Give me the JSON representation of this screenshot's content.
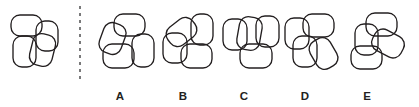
{
  "puzzle": {
    "type": "figure-matching-multiple-choice",
    "question_kind": "which-option-matches-reference-figure",
    "background_color": "#ffffff",
    "stroke_color": "#231f20",
    "divider_color": "#4d4d4f",
    "canvas": {
      "width": 419,
      "height": 107
    },
    "shape_primitive": "rounded-rectangle",
    "shapes_per_figure": 4,
    "divider": {
      "name": "dashed-vertical-divider",
      "x": 80,
      "y_top": 6,
      "y_bottom": 80,
      "style": "dashed"
    },
    "reference": {
      "name": "reference-figure",
      "shapes": [
        {
          "x": 11,
          "y": 15,
          "w": 31,
          "h": 21,
          "rx": 9,
          "rotate": 0,
          "cx": 26.5,
          "cy": 25.5
        },
        {
          "x": 36,
          "y": 21,
          "w": 22,
          "h": 30,
          "rx": 9,
          "rotate": 0,
          "cx": 47,
          "cy": 36
        },
        {
          "x": 13,
          "y": 36,
          "w": 23,
          "h": 31,
          "rx": 9,
          "rotate": 0,
          "cx": 24.5,
          "cy": 51.5
        },
        {
          "x": 31,
          "y": 34,
          "w": 23,
          "h": 32,
          "rx": 9,
          "rotate": 14,
          "cx": 42.5,
          "cy": 50
        }
      ]
    },
    "options": [
      {
        "id": "A",
        "label": "A",
        "name": "option-a",
        "label_x": 120,
        "label_y": 100,
        "shapes": [
          {
            "x": 114,
            "y": 14,
            "w": 31,
            "h": 22,
            "rx": 9,
            "rotate": 0,
            "cx": 129.5,
            "cy": 25
          },
          {
            "x": 101,
            "y": 23,
            "w": 23,
            "h": 31,
            "rx": 9,
            "rotate": 20,
            "cx": 112.5,
            "cy": 38.5
          },
          {
            "x": 103,
            "y": 44,
            "w": 31,
            "h": 24,
            "rx": 9,
            "rotate": 0,
            "cx": 118.5,
            "cy": 56
          },
          {
            "x": 132,
            "y": 34,
            "w": 22,
            "h": 33,
            "rx": 9,
            "rotate": 0,
            "cx": 143,
            "cy": 50.5
          }
        ]
      },
      {
        "id": "B",
        "label": "B",
        "name": "option-b",
        "label_x": 183,
        "label_y": 100,
        "shapes": [
          {
            "x": 166,
            "y": 21,
            "w": 31,
            "h": 22,
            "rx": 9,
            "rotate": -38,
            "cx": 181.5,
            "cy": 32
          },
          {
            "x": 191,
            "y": 14,
            "w": 22,
            "h": 31,
            "rx": 9,
            "rotate": 0,
            "cx": 202,
            "cy": 29.5
          },
          {
            "x": 163,
            "y": 33,
            "w": 24,
            "h": 30,
            "rx": 9,
            "rotate": 0,
            "cx": 175,
            "cy": 48
          },
          {
            "x": 181,
            "y": 44,
            "w": 31,
            "h": 24,
            "rx": 9,
            "rotate": 0,
            "cx": 196.5,
            "cy": 56
          }
        ]
      },
      {
        "id": "C",
        "label": "C",
        "name": "option-c",
        "label_x": 244,
        "label_y": 100,
        "shapes": [
          {
            "x": 223,
            "y": 19,
            "w": 24,
            "h": 31,
            "rx": 9,
            "rotate": 0,
            "cx": 235,
            "cy": 34.5
          },
          {
            "x": 238,
            "y": 17,
            "w": 23,
            "h": 33,
            "rx": 9,
            "rotate": 10,
            "cx": 249.5,
            "cy": 33.5
          },
          {
            "x": 256,
            "y": 16,
            "w": 23,
            "h": 31,
            "rx": 9,
            "rotate": 0,
            "cx": 267.5,
            "cy": 31.5
          },
          {
            "x": 240,
            "y": 44,
            "w": 32,
            "h": 24,
            "rx": 9,
            "rotate": 0,
            "cx": 256,
            "cy": 56
          }
        ]
      },
      {
        "id": "D",
        "label": "D",
        "name": "option-d",
        "label_x": 305,
        "label_y": 100,
        "shapes": [
          {
            "x": 285,
            "y": 18,
            "w": 24,
            "h": 31,
            "rx": 9,
            "rotate": 0,
            "cx": 297,
            "cy": 33.5
          },
          {
            "x": 303,
            "y": 14,
            "w": 31,
            "h": 23,
            "rx": 9,
            "rotate": 0,
            "cx": 318.5,
            "cy": 25.5
          },
          {
            "x": 293,
            "y": 36,
            "w": 24,
            "h": 31,
            "rx": 9,
            "rotate": 0,
            "cx": 305,
            "cy": 51.5
          },
          {
            "x": 312,
            "y": 38,
            "w": 23,
            "h": 31,
            "rx": 9,
            "rotate": -30,
            "cx": 323.5,
            "cy": 53.5
          }
        ]
      },
      {
        "id": "E",
        "label": "E",
        "name": "option-e",
        "label_x": 367,
        "label_y": 100,
        "shapes": [
          {
            "x": 366,
            "y": 13,
            "w": 31,
            "h": 23,
            "rx": 9,
            "rotate": 0,
            "cx": 381.5,
            "cy": 24.5
          },
          {
            "x": 355,
            "y": 24,
            "w": 23,
            "h": 31,
            "rx": 9,
            "rotate": 0,
            "cx": 366.5,
            "cy": 39.5
          },
          {
            "x": 372,
            "y": 32,
            "w": 32,
            "h": 23,
            "rx": 9,
            "rotate": 28,
            "cx": 388,
            "cy": 43.5
          },
          {
            "x": 351,
            "y": 46,
            "w": 31,
            "h": 23,
            "rx": 9,
            "rotate": 0,
            "cx": 366.5,
            "cy": 57.5
          }
        ]
      }
    ]
  }
}
